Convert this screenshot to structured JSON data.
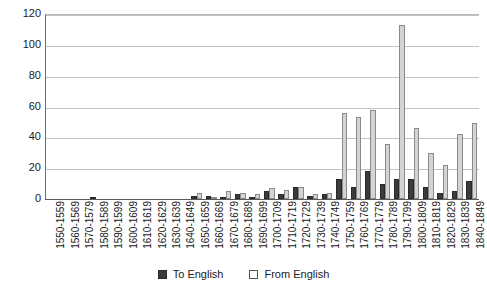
{
  "chart_data": {
    "type": "bar",
    "title": "",
    "xlabel": "",
    "ylabel": "",
    "ylim": [
      0,
      120
    ],
    "yticks": [
      0,
      20,
      40,
      60,
      80,
      100,
      120
    ],
    "grid": true,
    "legend_position": "bottom",
    "categories": [
      "1550-1559",
      "1560-1569",
      "1570-1579",
      "1580-1589",
      "1590-1599",
      "1600-1609",
      "1610-1619",
      "1620-1629",
      "1630-1639",
      "1640-1649",
      "1650-1659",
      "1660-1669",
      "1670-1679",
      "1680-1689",
      "1690-1699",
      "1700-1709",
      "1710-1719",
      "1720-1729",
      "1730-1739",
      "1740-1749",
      "1750-1759",
      "1760-1769",
      "1770-1779",
      "1780-1789",
      "1790-1799",
      "1800-1809",
      "1810-1819",
      "1820-1829",
      "1830-1839",
      "1840-1849"
    ],
    "series": [
      {
        "name": "To English",
        "color": "#3b3b3b",
        "values": [
          0,
          0,
          0,
          1,
          0,
          0,
          0,
          0,
          0,
          0,
          2,
          2,
          1,
          3,
          1,
          5,
          3,
          8,
          2,
          3,
          13,
          8,
          18,
          10,
          13,
          13,
          8,
          4,
          5,
          12
        ]
      },
      {
        "name": "From English",
        "color": "#d4d4d4",
        "values": [
          0,
          0,
          0,
          0,
          0,
          0,
          0,
          0,
          0,
          0,
          4,
          1,
          5,
          4,
          3,
          7,
          6,
          8,
          3,
          4,
          56,
          53,
          58,
          36,
          113,
          46,
          30,
          22,
          42,
          49
        ]
      }
    ]
  },
  "legend": {
    "items": [
      {
        "label": "To English",
        "swatch": "dark-filled-square"
      },
      {
        "label": "From English",
        "swatch": "light-outlined-square"
      }
    ]
  },
  "colors": {
    "to_english": "#3b3b3b",
    "from_english": "#d4d4d4",
    "gridline": "#c2c2c2",
    "axis": "#5a5a5a",
    "text": "#1a1a1a",
    "background": "#ffffff"
  }
}
